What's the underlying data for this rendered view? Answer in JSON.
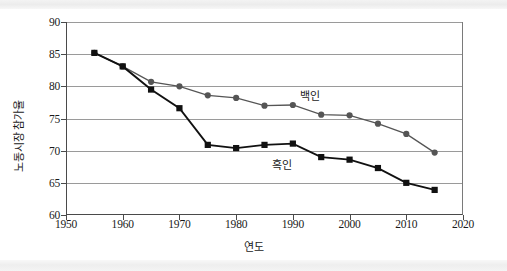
{
  "chart_data": {
    "type": "line",
    "title": "",
    "xlabel": "연도",
    "ylabel": "노동시장 참가율",
    "xlim": [
      1950,
      2020
    ],
    "ylim": [
      60,
      90
    ],
    "xticks": [
      1950,
      1960,
      1970,
      1980,
      1990,
      2000,
      2010,
      2020
    ],
    "yticks": [
      60,
      65,
      70,
      75,
      80,
      85,
      90
    ],
    "grid": "horizontal",
    "legend_position": "inline-annotation",
    "x": [
      1955,
      1960,
      1965,
      1970,
      1975,
      1980,
      1985,
      1990,
      1995,
      2000,
      2005,
      2010,
      2015
    ],
    "series": [
      {
        "name": "백인",
        "marker": "circle",
        "color": "#555555",
        "values": [
          85.2,
          83.1,
          80.7,
          80.0,
          78.6,
          78.2,
          77.0,
          77.1,
          75.6,
          75.5,
          74.2,
          72.6,
          69.7
        ],
        "label_text": "백인",
        "label_x": 1993,
        "label_y": 78.6
      },
      {
        "name": "흑인",
        "marker": "square",
        "color": "#111111",
        "values": [
          85.2,
          83.1,
          79.5,
          76.6,
          70.9,
          70.4,
          70.9,
          71.1,
          69.0,
          68.6,
          67.3,
          65.0,
          63.9
        ],
        "label_text": "흑인",
        "label_x": 1988,
        "label_y": 68.0
      }
    ]
  },
  "axis": {
    "x_tick_labels": [
      "1950",
      "1960",
      "1970",
      "1980",
      "1990",
      "2000",
      "2010",
      "2020"
    ],
    "y_tick_labels": [
      "60",
      "65",
      "70",
      "75",
      "80",
      "85",
      "90"
    ],
    "x_title": "연도",
    "y_title": "노동시장 참가율"
  }
}
